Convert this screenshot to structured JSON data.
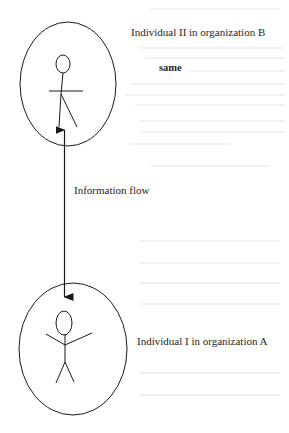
{
  "diagram": {
    "type": "information-flow",
    "nodes": [
      {
        "id": "individual-2",
        "label": "Individual II in organization B",
        "annotation": "same",
        "shape": "ellipse-with-stick-figure",
        "figure_pose": "arms-horizontal"
      },
      {
        "id": "individual-1",
        "label": "Individual I in organization A",
        "shape": "ellipse-with-stick-figure",
        "figure_pose": "arms-raised"
      }
    ],
    "edges": [
      {
        "from": "individual-1",
        "to": "individual-2",
        "direction": "bidirectional",
        "label": "Information flow"
      }
    ],
    "colors": {
      "stroke": "#1a1a1a",
      "background": "#ffffff"
    }
  }
}
